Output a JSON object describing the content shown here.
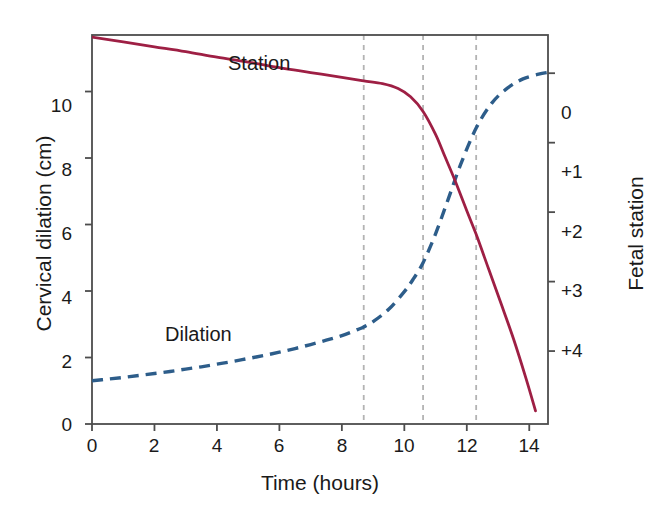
{
  "chart_data": {
    "type": "line",
    "title": "",
    "xlabel": "Time (hours)",
    "ylabel": "Cervical dilation (cm)",
    "y2label": "Fetal station",
    "xlim": [
      0,
      14.6
    ],
    "ylim": [
      0,
      11.7
    ],
    "y2lim": [
      -0.55,
      5.05
    ],
    "grid": false,
    "legend_position": "inline-annotations",
    "xticks": [
      "0",
      "2",
      "4",
      "6",
      "8",
      "10",
      "12",
      "14"
    ],
    "xtick_values": [
      0,
      2,
      4,
      6,
      8,
      10,
      12,
      14
    ],
    "yticks": [
      "0",
      "2",
      "4",
      "6",
      "8",
      "10"
    ],
    "ytick_values": [
      0,
      2,
      4,
      6,
      8,
      10
    ],
    "y2ticks": [
      "0",
      "+1",
      "+2",
      "+3",
      "+4"
    ],
    "y2tick_values": [
      0,
      1,
      2,
      3,
      4
    ],
    "annotations": [
      {
        "text": "Station",
        "x": 6.4,
        "y": 11.2
      },
      {
        "text": "Dilation",
        "x": 3.2,
        "y": 2.45
      }
    ],
    "vertical_reference_lines": [
      {
        "x": 8.7,
        "style": "dashed",
        "color": "#b3b3b3"
      },
      {
        "x": 10.6,
        "style": "dashed",
        "color": "#b3b3b3"
      },
      {
        "x": 12.3,
        "style": "dashed",
        "color": "#b3b3b3"
      }
    ],
    "series": [
      {
        "name": "Dilation",
        "axis": "left",
        "units": "cm",
        "color": "#2d5d8a",
        "style": "dashed",
        "x": [
          0.0,
          0.5,
          1.0,
          1.5,
          2.0,
          2.5,
          3.0,
          3.5,
          4.0,
          4.5,
          5.0,
          5.5,
          6.0,
          6.5,
          7.0,
          7.5,
          8.0,
          8.5,
          8.7,
          9.0,
          9.5,
          10.0,
          10.3,
          10.6,
          11.0,
          11.4,
          11.8,
          12.3,
          12.8,
          13.3,
          13.8,
          14.3,
          14.6
        ],
        "y": [
          1.3,
          1.35,
          1.4,
          1.46,
          1.52,
          1.58,
          1.65,
          1.72,
          1.8,
          1.88,
          1.97,
          2.06,
          2.16,
          2.27,
          2.39,
          2.52,
          2.66,
          2.84,
          2.92,
          3.08,
          3.45,
          3.98,
          4.38,
          4.85,
          5.72,
          6.75,
          7.8,
          8.9,
          9.65,
          10.1,
          10.38,
          10.52,
          10.58
        ]
      },
      {
        "name": "Station",
        "axis": "right",
        "units": "station",
        "color": "#9e1f44",
        "style": "solid",
        "x": [
          0.0,
          1.0,
          2.0,
          3.0,
          4.0,
          5.0,
          6.0,
          7.0,
          8.0,
          8.7,
          9.3,
          9.8,
          10.2,
          10.6,
          11.0,
          11.3,
          11.6,
          12.0,
          12.3,
          12.7,
          13.1,
          13.5,
          13.9,
          14.2
        ],
        "y": [
          -0.52,
          -0.45,
          -0.38,
          -0.31,
          -0.23,
          -0.16,
          -0.08,
          -0.01,
          0.06,
          0.11,
          0.15,
          0.22,
          0.34,
          0.55,
          0.88,
          1.2,
          1.52,
          1.98,
          2.32,
          2.82,
          3.32,
          3.83,
          4.4,
          4.86
        ]
      }
    ]
  },
  "plot_geometry": {
    "left": 92,
    "right": 548,
    "top": 35,
    "bottom": 424,
    "frame_color": "#4d4d4d"
  },
  "labels": {
    "y_axis_title": "Cervical dilation (cm)",
    "y2_axis_title": "Fetal station",
    "x_axis_title": "Time (hours)",
    "station_annotation": "Station",
    "dilation_annotation": "Dilation"
  },
  "ticks": {
    "x": [
      "0",
      "2",
      "4",
      "6",
      "8",
      "10",
      "12",
      "14"
    ],
    "y": [
      "10",
      "8",
      "6",
      "4",
      "2",
      "0"
    ],
    "y2": [
      "0",
      "+1",
      "+2",
      "+3",
      "+4"
    ]
  },
  "colors": {
    "station_line": "#9e1f44",
    "dilation_line": "#2d5d8a",
    "reference_line": "#b3b3b3",
    "frame": "#4d4d4d",
    "background": "#ffffff",
    "text": "#1a1a1a"
  }
}
